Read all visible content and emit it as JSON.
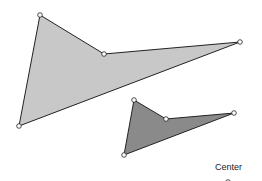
{
  "diagram": {
    "type": "geometric-dilation",
    "shapes": [
      {
        "name": "large-quadrilateral",
        "fill": "#c8c8c8",
        "stroke": "#222222",
        "points": [
          [
            40,
            15
          ],
          [
            104,
            54
          ],
          [
            240,
            42
          ],
          [
            19,
            126
          ]
        ]
      },
      {
        "name": "small-quadrilateral",
        "fill": "#8a8a8a",
        "stroke": "#222222",
        "points": [
          [
            134,
            100
          ],
          [
            166,
            119
          ],
          [
            234,
            113
          ],
          [
            124,
            155
          ]
        ]
      }
    ],
    "vertex_color": "#ffffff",
    "vertex_stroke": "#222222",
    "center_point": [
      228,
      183
    ],
    "center_label": "Center"
  }
}
